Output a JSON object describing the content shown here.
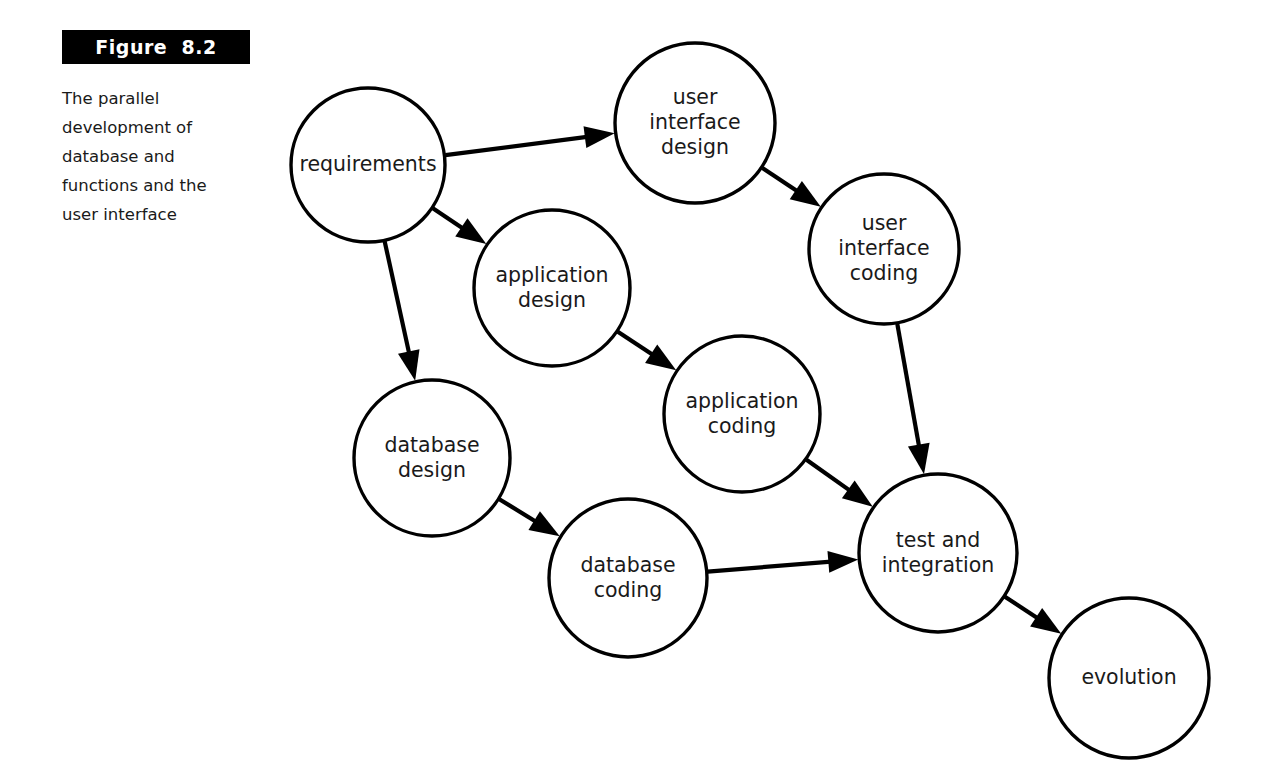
{
  "figure": {
    "banner_label": "Figure  8.2",
    "caption_lines": [
      "The parallel",
      "development of",
      "database and",
      "functions and the",
      "user interface"
    ],
    "caption_text": "The parallel development of database and functions and the user interface"
  },
  "colors": {
    "banner_background": "#000000",
    "banner_text": "#ffffff",
    "node_stroke": "#000000",
    "node_fill": "#ffffff",
    "edge": "#000000",
    "page_background": "#ffffff",
    "label_text": "#1a1a1a"
  },
  "diagram": {
    "type": "flow-diagram",
    "nodes": [
      {
        "id": "requirements",
        "label_lines": [
          "requirements"
        ],
        "cx": 368,
        "cy": 165,
        "r": 77
      },
      {
        "id": "ui-design",
        "label_lines": [
          "user",
          "interface",
          "design"
        ],
        "cx": 695,
        "cy": 123,
        "r": 80
      },
      {
        "id": "ui-coding",
        "label_lines": [
          "user",
          "interface",
          "coding"
        ],
        "cx": 884,
        "cy": 249,
        "r": 75
      },
      {
        "id": "app-design",
        "label_lines": [
          "application",
          "design"
        ],
        "cx": 552,
        "cy": 288,
        "r": 78
      },
      {
        "id": "db-design",
        "label_lines": [
          "database",
          "design"
        ],
        "cx": 432,
        "cy": 458,
        "r": 78
      },
      {
        "id": "app-coding",
        "label_lines": [
          "application",
          "coding"
        ],
        "cx": 742,
        "cy": 414,
        "r": 78
      },
      {
        "id": "db-coding",
        "label_lines": [
          "database",
          "coding"
        ],
        "cx": 628,
        "cy": 578,
        "r": 79
      },
      {
        "id": "test-integration",
        "label_lines": [
          "test and",
          "integration"
        ],
        "cx": 938,
        "cy": 553,
        "r": 79
      },
      {
        "id": "evolution",
        "label_lines": [
          "evolution"
        ],
        "cx": 1129,
        "cy": 678,
        "r": 80
      }
    ],
    "edges": [
      {
        "id": "requirements-to-ui-design",
        "from": "requirements",
        "to": "ui-design"
      },
      {
        "id": "requirements-to-app-design",
        "from": "requirements",
        "to": "app-design"
      },
      {
        "id": "requirements-to-db-design",
        "from": "requirements",
        "to": "db-design"
      },
      {
        "id": "ui-design-to-ui-coding",
        "from": "ui-design",
        "to": "ui-coding"
      },
      {
        "id": "app-design-to-app-coding",
        "from": "app-design",
        "to": "app-coding"
      },
      {
        "id": "db-design-to-db-coding",
        "from": "db-design",
        "to": "db-coding"
      },
      {
        "id": "ui-coding-to-test-integration",
        "from": "ui-coding",
        "to": "test-integration"
      },
      {
        "id": "app-coding-to-test-integration",
        "from": "app-coding",
        "to": "test-integration"
      },
      {
        "id": "db-coding-to-test-integration",
        "from": "db-coding",
        "to": "test-integration"
      },
      {
        "id": "test-integration-to-evolution",
        "from": "test-integration",
        "to": "evolution"
      }
    ]
  }
}
